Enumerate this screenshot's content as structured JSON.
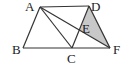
{
  "diagram": {
    "points": {
      "A": {
        "label": "A",
        "x": 40,
        "y": 7,
        "lx": 25,
        "ly": 11
      },
      "B": {
        "label": "B",
        "x": 23,
        "y": 48,
        "lx": 12,
        "ly": 54
      },
      "C": {
        "label": "C",
        "x": 72,
        "y": 48,
        "lx": 67,
        "ly": 62
      },
      "D": {
        "label": "D",
        "x": 89,
        "y": 6,
        "lx": 91,
        "ly": 11
      },
      "E": {
        "label": "E",
        "x": 80,
        "y": 30,
        "lx": 82,
        "ly": 33
      },
      "F": {
        "label": "F",
        "x": 110,
        "y": 48,
        "lx": 114,
        "ly": 54
      }
    },
    "shaded_region": "DEF",
    "shade_color": "#c8c8c8",
    "stroke_color": "#333333"
  }
}
